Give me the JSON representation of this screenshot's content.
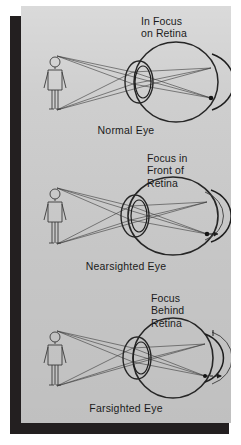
{
  "figure": {
    "background_color": "#cccccc",
    "border_color": "#231f20",
    "ink_color": "#2b2b2b",
    "panels": [
      {
        "id": "normal",
        "focus_label": "In Focus\non Retina",
        "caption": "Normal Eye",
        "eye_shape": "round",
        "focus_position": "on-retina",
        "object": "standing-person"
      },
      {
        "id": "nearsighted",
        "focus_label": "Focus in\nFront of\nRetina",
        "caption": "Nearsighted Eye",
        "eye_shape": "elongated",
        "focus_position": "in-front-of-retina",
        "object": "standing-person"
      },
      {
        "id": "farsighted",
        "focus_label": "Focus\nBehind\nRetina",
        "caption": "Farsighted Eye",
        "eye_shape": "shortened",
        "focus_position": "behind-retina",
        "object": "standing-person"
      }
    ]
  }
}
